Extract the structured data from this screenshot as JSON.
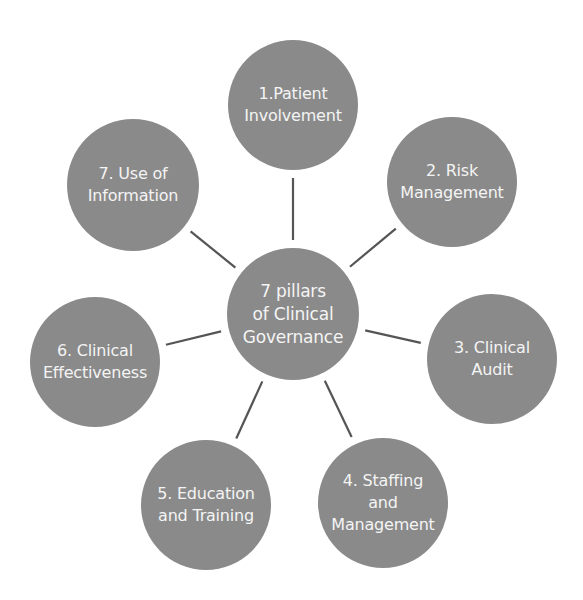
{
  "diagram": {
    "center": {
      "lines": [
        "7 pillars",
        "of Clinical",
        "Governance"
      ],
      "cx": 293,
      "cy": 314,
      "r": 66
    },
    "pillars": [
      {
        "lines": [
          "1.Patient",
          "Involvement"
        ],
        "cx": 293,
        "cy": 105,
        "r": 65
      },
      {
        "lines": [
          "2. Risk",
          "Management"
        ],
        "cx": 452,
        "cy": 182,
        "r": 65
      },
      {
        "lines": [
          "3. Clinical",
          "Audit"
        ],
        "cx": 492,
        "cy": 359,
        "r": 65
      },
      {
        "lines": [
          "4. Staffing",
          "and",
          "Management"
        ],
        "cx": 383,
        "cy": 503,
        "r": 65
      },
      {
        "lines": [
          "5. Education",
          "and Training"
        ],
        "cx": 206,
        "cy": 505,
        "r": 65
      },
      {
        "lines": [
          "6. Clinical",
          "Effectiveness"
        ],
        "cx": 95,
        "cy": 362,
        "r": 65
      },
      {
        "lines": [
          "7. Use of",
          "Information"
        ],
        "cx": 133,
        "cy": 185,
        "r": 66
      }
    ],
    "colors": {
      "node_fill": "#8a8a8a",
      "node_text": "#f4f4f4",
      "connector": "#555555",
      "background": "#ffffff"
    }
  }
}
